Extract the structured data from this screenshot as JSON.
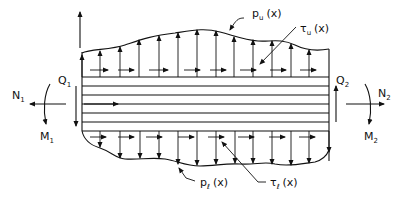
{
  "diagram": {
    "type": "free-body diagram of layered beam element",
    "colors": {
      "ink": "#111111",
      "background": "#ffffff"
    },
    "labels": {
      "p_upper": {
        "main": "p",
        "sub": "u",
        "arg": "(x)"
      },
      "tau_upper": {
        "main": "τ",
        "sub": "u",
        "arg": "(x)"
      },
      "p_lower": {
        "main": "p",
        "sub": "ℓ",
        "arg": "(x)"
      },
      "tau_lower": {
        "main": "τ",
        "sub": "ℓ",
        "arg": "(x)"
      },
      "Q1": {
        "main": "Q",
        "sub": "1"
      },
      "Q2": {
        "main": "Q",
        "sub": "2"
      },
      "N1": {
        "main": "N",
        "sub": "1"
      },
      "N2": {
        "main": "N",
        "sub": "2"
      },
      "M1": {
        "main": "M",
        "sub": "1"
      },
      "M2": {
        "main": "M",
        "sub": "2"
      }
    },
    "beam": {
      "layers": 6
    }
  }
}
